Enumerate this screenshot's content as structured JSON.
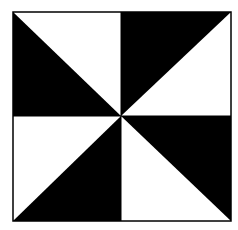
{
  "figure": {
    "colors": {
      "fill": "#000000",
      "background": "#ffffff",
      "border": "#000000"
    },
    "square": {
      "x0": 13,
      "y0": 12,
      "x1": 231,
      "y1": 221
    },
    "center": {
      "x": 121,
      "y": 116
    }
  }
}
